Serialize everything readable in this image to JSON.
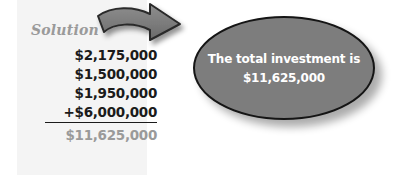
{
  "slide": {
    "background_color": "#ffffff"
  },
  "solution": {
    "label": "Solution",
    "label_color": "#9a9a9a",
    "panel_color": "#f4f4f4",
    "amounts": [
      {
        "text": "$2,175,000",
        "underlined": false,
        "is_total": false
      },
      {
        "text": "$1,500,000",
        "underlined": false,
        "is_total": false
      },
      {
        "text": "$1,950,000",
        "underlined": false,
        "is_total": false
      },
      {
        "text": "+$6,000,000",
        "underlined": true,
        "is_total": false
      },
      {
        "text": "$11,625,000",
        "underlined": false,
        "is_total": true
      }
    ],
    "amount_color": "#1b1b1b",
    "total_color": "#9a9a9a"
  },
  "arrow": {
    "icon": "curved-arrow-right-icon",
    "fill_color": "#7d7d7d",
    "outline_color": "#2a2a2a"
  },
  "callout": {
    "shape": "oval",
    "fill_color": "#7d7d7d",
    "outline_color": "#151515",
    "text_color": "#ffffff",
    "lines": [
      "The total investment is",
      "$11,625,000"
    ]
  }
}
